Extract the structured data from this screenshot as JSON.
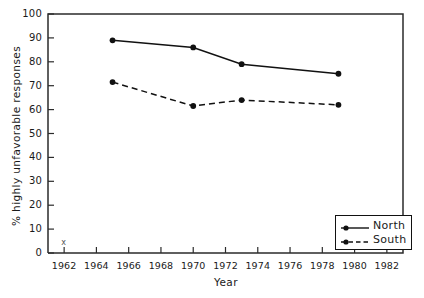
{
  "chart_data": {
    "type": "line",
    "title": "",
    "xlabel": "Year",
    "ylabel": "% highly unfavorable responses",
    "xlim": [
      1961,
      1983
    ],
    "ylim": [
      0,
      100
    ],
    "grid": false,
    "legend_position": "bottom-right inside axes",
    "xticks": [
      1962,
      1964,
      1966,
      1968,
      1970,
      1972,
      1974,
      1976,
      1978,
      1980,
      1982
    ],
    "xtick_labels": [
      "1962",
      "1964",
      "1966",
      "1968",
      "1970",
      "1972",
      "1974",
      "1976",
      "1978",
      "1980",
      "1982"
    ],
    "yticks": [
      0,
      10,
      20,
      30,
      40,
      50,
      60,
      70,
      80,
      90,
      100
    ],
    "ytick_labels": [
      "0",
      "10",
      "20",
      "30",
      "40",
      "50",
      "60",
      "70",
      "80",
      "90",
      "100"
    ],
    "series": [
      {
        "name": "North",
        "line_style": "solid",
        "marker": "filled-circle",
        "color": "#111111",
        "x": [
          1965,
          1970,
          1973,
          1979
        ],
        "values": [
          89,
          86,
          79,
          75
        ]
      },
      {
        "name": "South",
        "line_style": "dashed",
        "marker": "filled-circle",
        "color": "#111111",
        "x": [
          1965,
          1970,
          1973,
          1979
        ],
        "values": [
          71.5,
          61.5,
          64,
          62
        ]
      }
    ],
    "annotations": [
      {
        "text": "x",
        "x": 1962,
        "y": 4
      }
    ]
  },
  "legend": {
    "entries": [
      {
        "label": "North"
      },
      {
        "label": "South"
      }
    ]
  },
  "axes": {
    "x_title": "Year",
    "y_title": "% highly unfavorable responses"
  }
}
